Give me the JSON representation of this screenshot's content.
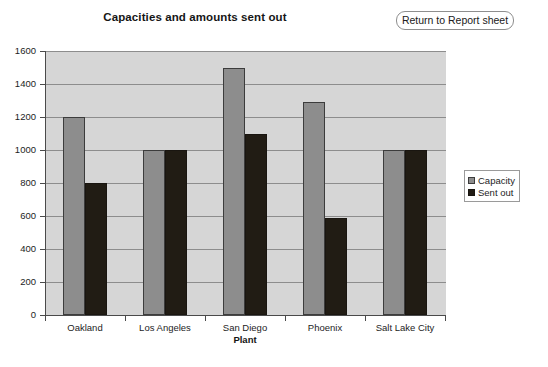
{
  "header": {
    "title": "Capacities and amounts sent out",
    "return_button_label": "Return to Report sheet"
  },
  "chart_data": {
    "type": "bar",
    "title": "Capacities and amounts sent out",
    "xlabel": "Plant",
    "ylabel": "",
    "ylim": [
      0,
      1600
    ],
    "ytick_step": 200,
    "yticks": [
      1600,
      1400,
      1200,
      1000,
      800,
      600,
      400,
      200,
      0
    ],
    "grid": true,
    "legend_position": "right",
    "categories": [
      "Oakland",
      "Los Angeles",
      "San Diego",
      "Phoenix",
      "Salt Lake City"
    ],
    "series": [
      {
        "name": "Capacity",
        "color": "#8d8d8d",
        "values": [
          1200,
          1000,
          1500,
          1290,
          1000
        ]
      },
      {
        "name": "Sent out",
        "color": "#211c14",
        "values": [
          800,
          1000,
          1100,
          590,
          1000
        ]
      }
    ]
  },
  "colors": {
    "plot_background": "#d6d6d6",
    "gridline": "#8d8d8d",
    "axis": "#4a4a4a",
    "capacity": "#8d8d8d",
    "sent_out": "#211c14"
  }
}
